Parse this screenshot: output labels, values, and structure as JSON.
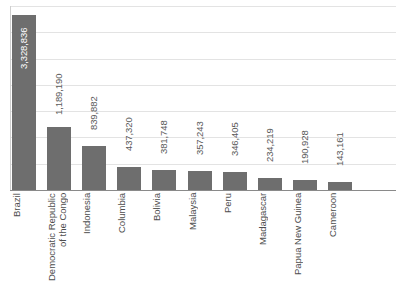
{
  "chart_data": {
    "type": "bar",
    "title": "",
    "xlabel": "",
    "ylabel": "",
    "ylim": [
      0,
      3500000
    ],
    "grid": true,
    "legend": false,
    "gridline_step": 500000,
    "orientation": "vertical",
    "bar_color": "#6e6e6e",
    "gridline_color": "#e3e3e3",
    "axis_color": "#8a8a8a",
    "categories": [
      "Brazil",
      "Democratic Republic\nof the Congo",
      "Indonesia",
      "Columbia",
      "Bolivia",
      "Malaysia",
      "Peru",
      "Madagascar",
      "Papua New Guinea",
      "Cameroon"
    ],
    "values": [
      3328836,
      1189190,
      839882,
      437320,
      381748,
      357243,
      346405,
      234219,
      190928,
      143161
    ],
    "value_labels": [
      "3,328,836",
      "1,189,190",
      "839,882",
      "437,320",
      "381,748",
      "357,243",
      "346,405",
      "234,219",
      "190,928",
      "143,161"
    ],
    "label_placement": [
      "inside",
      "outside",
      "outside",
      "outside",
      "outside",
      "outside",
      "outside",
      "outside",
      "outside",
      "outside"
    ]
  }
}
